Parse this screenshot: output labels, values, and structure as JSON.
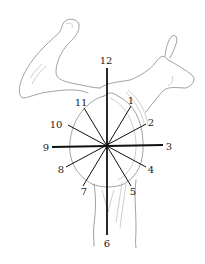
{
  "diagram": {
    "center": [
      107,
      146
    ],
    "colors": {
      "lines": "#111111",
      "bone_outline": "#8a8a8a",
      "background": "#ffffff"
    },
    "labels": [
      {
        "id": "12",
        "text": "12",
        "x": 106,
        "y": 64
      },
      {
        "id": "1",
        "text": "1",
        "x": 131,
        "y": 104
      },
      {
        "id": "2",
        "text": "2",
        "x": 151,
        "y": 126
      },
      {
        "id": "3",
        "text": "3",
        "x": 169,
        "y": 150
      },
      {
        "id": "4",
        "text": "4",
        "x": 151,
        "y": 173
      },
      {
        "id": "5",
        "text": "5",
        "x": 133,
        "y": 195
      },
      {
        "id": "6",
        "text": "6",
        "x": 107,
        "y": 247
      },
      {
        "id": "7",
        "text": "7",
        "x": 84,
        "y": 195
      },
      {
        "id": "8",
        "text": "8",
        "x": 61,
        "y": 173
      },
      {
        "id": "9",
        "text": "9",
        "x": 46,
        "y": 151
      },
      {
        "id": "10",
        "text": "10",
        "x": 56,
        "y": 128
      },
      {
        "id": "11",
        "text": "11",
        "x": 81,
        "y": 106
      }
    ]
  }
}
